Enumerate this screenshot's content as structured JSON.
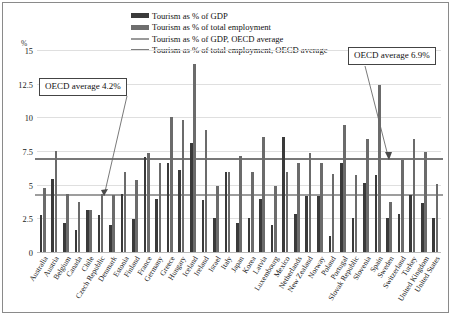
{
  "chart_data": {
    "type": "bar",
    "title": "",
    "subtitle": "",
    "xlabel": "",
    "ylabel": "%",
    "ylim": [
      0,
      15
    ],
    "yticks": [
      "0",
      "2.5",
      "5",
      "7.5",
      "10",
      "12.5",
      "15"
    ],
    "ytick_values": [
      0,
      2.5,
      5,
      7.5,
      10,
      12.5,
      15
    ],
    "grid": true,
    "legend_position": "top-center",
    "legend": [
      "Tourism as % of GDP",
      "Tourism as % of total employment",
      "Tourism as % of GDP, OECD average",
      "Tourism as % of total employment, OECD average"
    ],
    "categories": [
      "Australia",
      "Austria",
      "Belgium",
      "Canada",
      "Chile",
      "Czech Republic",
      "Denmark",
      "Estonia",
      "Finland",
      "France",
      "Germany",
      "Greece",
      "Hungary",
      "Iceland",
      "Ireland",
      "Israel",
      "Italy",
      "Japan",
      "Korea",
      "Latvia",
      "Luxembourg",
      "Mexico",
      "Netherlands",
      "New Zealand",
      "Norway",
      "Poland",
      "Portugal",
      "Slovak Republic",
      "Slovenia",
      "Spain",
      "Sweden",
      "Switzerland",
      "Turkey",
      "United Kingdom",
      "United States"
    ],
    "series": [
      {
        "name": "Tourism as % of GDP",
        "color": "#3a3a3a",
        "values": [
          2.8,
          5.5,
          2.2,
          1.7,
          3.2,
          2.8,
          2.1,
          4.4,
          2.5,
          7.1,
          4.0,
          6.7,
          6.2,
          8.2,
          3.9,
          2.6,
          6.0,
          2.2,
          2.6,
          4.0,
          2.1,
          8.6,
          2.9,
          4.2,
          4.2,
          1.3,
          6.7,
          2.6,
          5.2,
          5.8,
          2.6,
          2.9,
          4.3,
          3.7,
          2.6
        ]
      },
      {
        "name": "Tourism as % of total employment",
        "color": "#6b6b6b",
        "values": [
          4.8,
          7.6,
          4.4,
          3.8,
          3.2,
          4.4,
          4.3,
          6.0,
          5.4,
          7.4,
          6.7,
          10.1,
          9.9,
          14.0,
          9.1,
          5.0,
          6.0,
          7.2,
          6.0,
          8.6,
          5.0,
          6.0,
          6.7,
          7.4,
          6.7,
          5.9,
          9.5,
          5.8,
          8.5,
          12.5,
          3.8,
          6.9,
          8.5,
          7.5,
          5.1
        ]
      }
    ],
    "reference_lines": [
      {
        "name": "Tourism as % of GDP, OECD average",
        "value": 4.2,
        "color": "#9d9d9d",
        "annotation": "OECD average 4.2%"
      },
      {
        "name": "Tourism as % of total employment, OECD average",
        "value": 6.9,
        "color": "#787878",
        "annotation": "OECD average 6.9%"
      }
    ]
  },
  "annotations": {
    "gdp_average_box": "OECD average 4.2%",
    "employment_average_box": "OECD average 6.9%"
  },
  "axis": {
    "y_unit_label": "%"
  }
}
